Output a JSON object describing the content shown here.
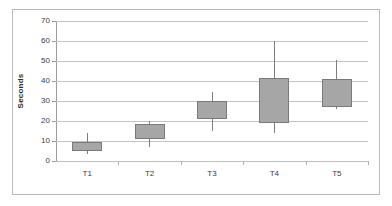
{
  "chart_data": {
    "type": "box",
    "title": "",
    "subtitle": "",
    "xlabel": "",
    "ylabel": "Seconds",
    "categories": [
      "T1",
      "T2",
      "T3",
      "T4",
      "T5"
    ],
    "ylim": [
      0,
      70
    ],
    "ytick_interval": 10,
    "ytick_labels": [
      "0",
      "10",
      "20",
      "30",
      "40",
      "50",
      "60",
      "70"
    ],
    "ytick_values": [
      0,
      10,
      20,
      30,
      40,
      50,
      60,
      70
    ],
    "grid": true,
    "legend": false,
    "legend_position": "none",
    "series": [
      {
        "name": "T1",
        "whisker_low": 3.5,
        "q1": 5.0,
        "median": 9.5,
        "q3": 9.5,
        "whisker_high": 14.0
      },
      {
        "name": "T2",
        "whisker_low": 7.0,
        "q1": 10.8,
        "median": 10.8,
        "q3": 18.4,
        "whisker_high": 20.2
      },
      {
        "name": "T3",
        "whisker_low": 15.0,
        "q1": 21.0,
        "median": 21.0,
        "q3": 30.0,
        "whisker_high": 34.5
      },
      {
        "name": "T4",
        "whisker_low": 14.0,
        "q1": 19.0,
        "median": 19.0,
        "q3": 41.5,
        "whisker_high": 60.2
      },
      {
        "name": "T5",
        "whisker_low": 26.0,
        "q1": 27.2,
        "median": 27.2,
        "q3": 40.8,
        "whisker_high": 50.4
      }
    ],
    "colors": {
      "box_fill": "#a6a6a6",
      "box_border": "#7a7a7a",
      "whisker": "#7d7d7d",
      "gridline": "#c3c3c3",
      "axis": "#9a9a9a",
      "text": "#3b3b3b",
      "background": "#ffffff",
      "frame_border": "#b9b9b9"
    }
  }
}
